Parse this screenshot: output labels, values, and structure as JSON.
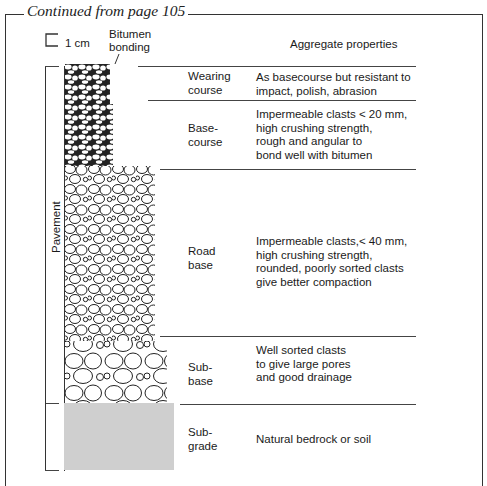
{
  "header": {
    "continued": "Continued from page 105"
  },
  "scale": {
    "label": "1 cm"
  },
  "bitumen_label": [
    "Bitumen",
    "bonding"
  ],
  "column_header": "Aggregate properties",
  "pavement_label": "Pavement",
  "layers": [
    {
      "name": [
        "Wearing",
        "course"
      ],
      "properties": [
        "As basecourse but resistant to",
        "impact, polish, abrasion"
      ]
    },
    {
      "name": [
        "Base-",
        "course"
      ],
      "properties": [
        "Impermeable clasts < 20 mm,",
        "high crushing strength,",
        "rough and angular to",
        "bond well with bitumen"
      ]
    },
    {
      "name": [
        "Road",
        "base"
      ],
      "properties": [
        "Impermeable clasts,< 40 mm,",
        "high crushing strength,",
        "rounded, poorly sorted clasts",
        "give better compaction"
      ]
    },
    {
      "name": [
        "Sub-",
        "base"
      ],
      "properties": [
        "Well sorted clasts",
        "to give large pores",
        "and good drainage"
      ]
    },
    {
      "name": [
        "Sub-",
        "grade"
      ],
      "properties": [
        "Natural bedrock or soil"
      ]
    }
  ],
  "colors": {
    "line": "#444444",
    "subgrade_fill": "#cfcfcf",
    "bitumen": "#222222"
  }
}
